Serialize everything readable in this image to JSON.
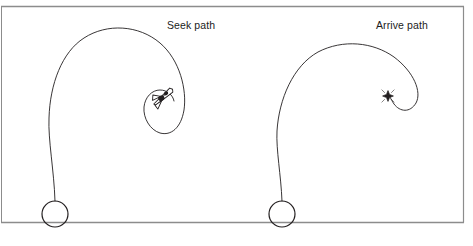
{
  "figure": {
    "background_color": "#ffffff",
    "stroke_color": "#231f20",
    "frame": {
      "name": "figure-border",
      "top_rule_y": 6,
      "bottom_rule_y": 222,
      "left_x": 1,
      "right_x": 464,
      "line_color": "#8c8c8c",
      "line_width": 1
    },
    "panels": [
      {
        "id": "seek",
        "label": "Seek path",
        "label_x": 167,
        "label_y": 19,
        "start_marker": {
          "type": "circle",
          "name": "seek-start-circle",
          "cx": 55,
          "cy": 214,
          "r": 13
        },
        "target_marker": {
          "type": "vehicle-dart",
          "name": "seek-vehicle-icon",
          "cx": 162,
          "cy": 96,
          "rotation_deg": -28
        },
        "path_d": "M 55 201 C 54 170 48 140 49 118 C 50 84 62 52 84 38 C 107 23 139 25 160 43 C 180 60 187 90 184 110 C 181 128 171 136 160 133 C 150 130 143 118 144 107 C 145 97 152 90 160 90 C 167 90 173 95 174 101"
      },
      {
        "id": "arrive",
        "label": "Arrive path",
        "label_x": 376,
        "label_y": 19,
        "start_marker": {
          "type": "circle",
          "name": "arrive-start-circle",
          "cx": 282,
          "cy": 214,
          "r": 13
        },
        "target_marker": {
          "type": "diamond-star",
          "name": "arrive-target-icon",
          "cx": 388,
          "cy": 96,
          "rotation_deg": 0
        },
        "path_d": "M 282 201 C 281 175 276 150 277 131 C 279 99 293 66 318 52 C 343 39 373 42 394 57 C 414 72 422 92 416 103 C 410 113 400 112 394 104 C 390 98 390 96 389 96"
      }
    ]
  }
}
